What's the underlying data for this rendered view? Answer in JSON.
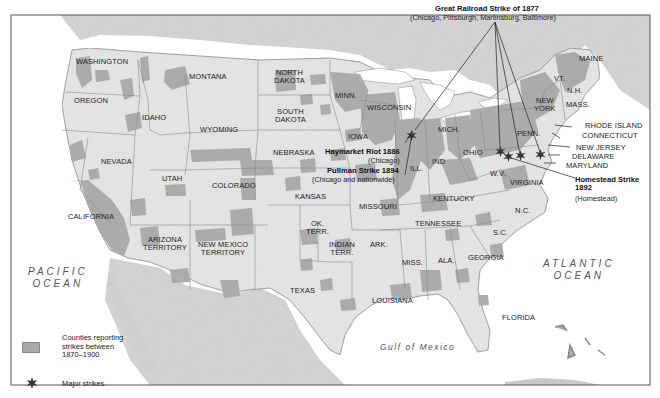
{
  "map": {
    "colors": {
      "land": "#e6e6e6",
      "foreign_land": "#d2d2d2",
      "strike_counties": "#a9a9a9",
      "water": "#ffffff",
      "border": "#777777",
      "frame": "#555555"
    },
    "oceans": {
      "pacific_line1": "PACIFIC",
      "pacific_line2": "OCEAN",
      "atlantic_line1": "ATLANTIC",
      "atlantic_line2": "OCEAN",
      "gulf": "Gulf of Mexico"
    },
    "states": {
      "washington": "WASHINGTON",
      "oregon": "OREGON",
      "california": "CALIFORNIA",
      "nevada": "NEVADA",
      "idaho": "IDAHO",
      "montana": "MONTANA",
      "wyoming": "WYOMING",
      "utah": "UTAH",
      "colorado": "COLORADO",
      "arizona_1": "ARIZONA",
      "arizona_2": "TERRITORY",
      "new_mexico_1": "NEW MEXICO",
      "new_mexico_2": "TERRITORY",
      "north_dakota_1": "NORTH",
      "north_dakota_2": "DAKOTA",
      "south_dakota_1": "SOUTH",
      "south_dakota_2": "DAKOTA",
      "nebraska": "NEBRASKA",
      "kansas": "KANSAS",
      "ok_terr_1": "OK.",
      "ok_terr_2": "TERR.",
      "indian_terr_1": "INDIAN",
      "indian_terr_2": "TERR.",
      "texas": "TEXAS",
      "minn": "MINN.",
      "iowa": "IOWA",
      "missouri": "MISSOURI",
      "ark": "ARK.",
      "louisiana": "LOUISIANA",
      "wisconsin": "WISCONSIN",
      "ill": "ILL.",
      "mich": "MICH.",
      "ind": "IND",
      "ohio": "OHIO",
      "kentucky": "KENTUCKY",
      "tennessee": "TENNESSEE",
      "miss": "MISS.",
      "ala": "ALA.",
      "georgia": "GEORGIA",
      "florida": "FLORIDA",
      "sc": "S.C.",
      "nc": "N.C.",
      "virginia": "VIRGINIA",
      "wv": "W.V.",
      "penn": "PENN.",
      "new_york_1": "NEW",
      "new_york_2": "YORK",
      "vt": "VT.",
      "nh": "N.H.",
      "maine": "MAINE",
      "mass": "MASS.",
      "rhode_island": "RHODE ISLAND",
      "connecticut": "CONNECTICUT",
      "new_jersey": "NEW JERSEY",
      "delaware": "DELAWARE",
      "maryland": "MARYLAND"
    },
    "strikes": {
      "great_railroad": {
        "title": "Great Railroad Strike of 1877",
        "locations": "(Chicago, Pittsburgh, Martinsburg, Baltimore)"
      },
      "haymarket": {
        "title": "Haymarket Riot 1886",
        "locations": "(Chicago)"
      },
      "pullman": {
        "title": "Pullman Strike 1894",
        "locations": "(Chicago and nationwide)"
      },
      "homestead": {
        "title_1": "Homestead Strike",
        "title_2": "1892",
        "locations": "(Homestead)"
      }
    },
    "legend": {
      "counties_line1": "Counties reporting",
      "counties_line2": "strikes between",
      "counties_line3": "1870–1900",
      "major_strikes": "Major strikes"
    }
  }
}
